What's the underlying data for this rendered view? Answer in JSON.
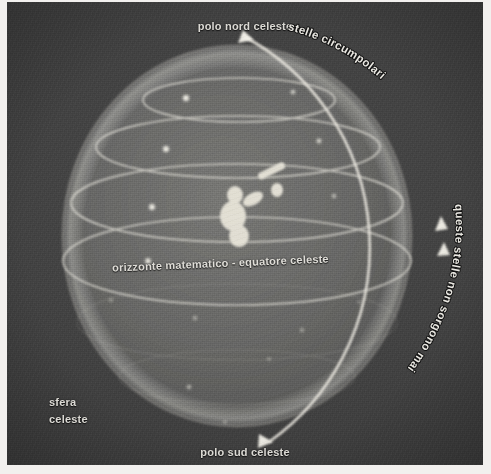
{
  "figure": {
    "kind": "celestial-sphere-diagram",
    "language": "it",
    "background_color": "#3c3c3c",
    "ink_color": "#e8e6e0",
    "paper_margin_color": "#f2f0ee"
  },
  "labels": {
    "north_pole": "polo nord celeste",
    "south_pole": "polo sud celeste",
    "equator": "orizzonte matematico - equatore celeste",
    "sphere_line1": "sfera",
    "sphere_line2": "celeste",
    "circumpolar": "stelle circumpolari",
    "never_rise": "queste stelle non sorgono mai"
  },
  "diagram": {
    "sphere": {
      "center_x": 237,
      "center_y": 236,
      "radius_x": 172,
      "radius_y": 188
    },
    "meridian_arc": {
      "description": "outer great-circle arc carrying the diurnal-motion arrowheads",
      "arrow_count": 4
    },
    "parallel_circles": [
      {
        "name": "circumpolar-upper",
        "cy": 98,
        "rx": 96,
        "ry": 22
      },
      {
        "name": "circumpolar-lower",
        "cy": 146,
        "rx": 143,
        "ry": 32
      },
      {
        "name": "tropic-upper",
        "cy": 201,
        "rx": 167,
        "ry": 40
      },
      {
        "name": "celestial-equator",
        "cy": 262,
        "rx": 172,
        "ry": 44
      }
    ],
    "observer": {
      "label": "osservatore",
      "x": 243,
      "y": 212,
      "holds": "telescope"
    },
    "stars": [
      {
        "x": 186,
        "y": 96
      },
      {
        "x": 293,
        "y": 92
      },
      {
        "x": 166,
        "y": 148
      },
      {
        "x": 317,
        "y": 140
      },
      {
        "x": 152,
        "y": 207
      },
      {
        "x": 332,
        "y": 196
      },
      {
        "x": 148,
        "y": 262
      },
      {
        "x": 196,
        "y": 318
      },
      {
        "x": 300,
        "y": 330
      },
      {
        "x": 190,
        "y": 388
      },
      {
        "x": 268,
        "y": 360
      },
      {
        "x": 110,
        "y": 300
      }
    ]
  }
}
